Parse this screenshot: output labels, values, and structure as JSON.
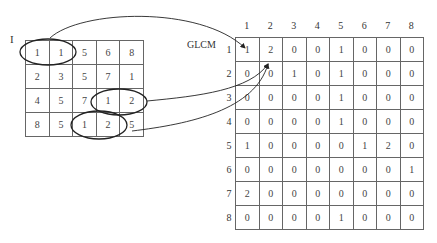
{
  "image_label": "I",
  "glcm_label": "GLCM",
  "image_matrix": [
    [
      "1",
      "1",
      "5",
      "6",
      "8"
    ],
    [
      "2",
      "3",
      "5",
      "7",
      "1"
    ],
    [
      "4",
      "5",
      "7",
      "1",
      "2"
    ],
    [
      "8",
      "5",
      "1",
      "2",
      "5"
    ]
  ],
  "glcm": {
    "col_headers": [
      "1",
      "2",
      "3",
      "4",
      "5",
      "6",
      "7",
      "8"
    ],
    "row_headers": [
      "1",
      "2",
      "3",
      "4",
      "5",
      "6",
      "7",
      "8"
    ],
    "rows": [
      [
        "1",
        "2",
        "0",
        "0",
        "1",
        "0",
        "0",
        "0"
      ],
      [
        "0",
        "0",
        "1",
        "0",
        "1",
        "0",
        "0",
        "0"
      ],
      [
        "0",
        "0",
        "0",
        "0",
        "1",
        "0",
        "0",
        "0"
      ],
      [
        "0",
        "0",
        "0",
        "0",
        "1",
        "0",
        "0",
        "0"
      ],
      [
        "1",
        "0",
        "0",
        "0",
        "0",
        "1",
        "2",
        "0"
      ],
      [
        "0",
        "0",
        "0",
        "0",
        "0",
        "0",
        "0",
        "1"
      ],
      [
        "2",
        "0",
        "0",
        "0",
        "0",
        "0",
        "0",
        "0"
      ],
      [
        "0",
        "0",
        "0",
        "0",
        "1",
        "0",
        "0",
        "0"
      ]
    ]
  },
  "highlighted_pairs": [
    {
      "pair": "(1,1)",
      "maps_to": "GLCM[1][1]"
    },
    {
      "pair": "(1,2)",
      "maps_to": "GLCM[1][2]"
    },
    {
      "pair": "(1,2)",
      "maps_to": "GLCM[1][2]"
    }
  ],
  "colors": {
    "line": "#222222",
    "grid": "#666666",
    "text": "#333333"
  }
}
